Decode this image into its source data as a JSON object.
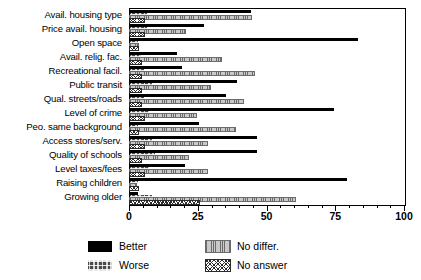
{
  "chart_data": {
    "type": "bar",
    "orientation": "horizontal",
    "title": "",
    "xlabel": "",
    "ylabel": "",
    "xlim": [
      0,
      100
    ],
    "xticks": [
      0,
      25,
      50,
      75,
      100
    ],
    "xtick_labels": [
      "0",
      "25",
      "50",
      "75",
      "100"
    ],
    "grid": false,
    "legend_position": "bottom-left",
    "categories": [
      "Avail. housing type",
      "Price avail. housing",
      "Open space",
      "Avail. relig. fac.",
      "Recreational facil.",
      "Public transit",
      "Qual. streets/roads",
      "Level of crime",
      "Peo. same background",
      "Access stores/serv.",
      "Quality of schools",
      "Level taxes/fees",
      "Raising children",
      "Growing older"
    ],
    "series": [
      {
        "name": "Better",
        "color": "#000000",
        "pattern": "solid",
        "values": [
          44,
          27,
          83,
          17,
          19,
          39,
          35,
          74,
          25,
          46,
          46,
          20,
          79,
          3
        ]
      },
      {
        "name": "Worse",
        "color": "#4a4a4a",
        "pattern": "fine-dotted",
        "values": [
          6,
          6,
          3,
          4,
          5,
          8,
          5,
          7,
          3,
          8,
          9,
          7,
          3,
          8
        ]
      },
      {
        "name": "No differ.",
        "color": "#c9c9c9",
        "pattern": "vertical-stipple",
        "values": [
          44,
          20,
          3,
          33,
          45,
          29,
          41,
          24,
          38,
          28,
          21,
          28,
          2,
          60
        ]
      },
      {
        "name": "No answer",
        "color": "#ffffff",
        "pattern": "cross-hatch",
        "values": [
          5,
          5,
          3,
          4,
          4,
          4,
          4,
          5,
          3,
          5,
          4,
          5,
          3,
          25
        ]
      }
    ]
  },
  "legend": {
    "items": [
      {
        "label": "Better",
        "style": "s-better"
      },
      {
        "label": "No differ.",
        "style": "s-nodiffer"
      },
      {
        "label": "Worse",
        "style": "s-worse"
      },
      {
        "label": "No answer",
        "style": "s-noanswer"
      }
    ]
  }
}
